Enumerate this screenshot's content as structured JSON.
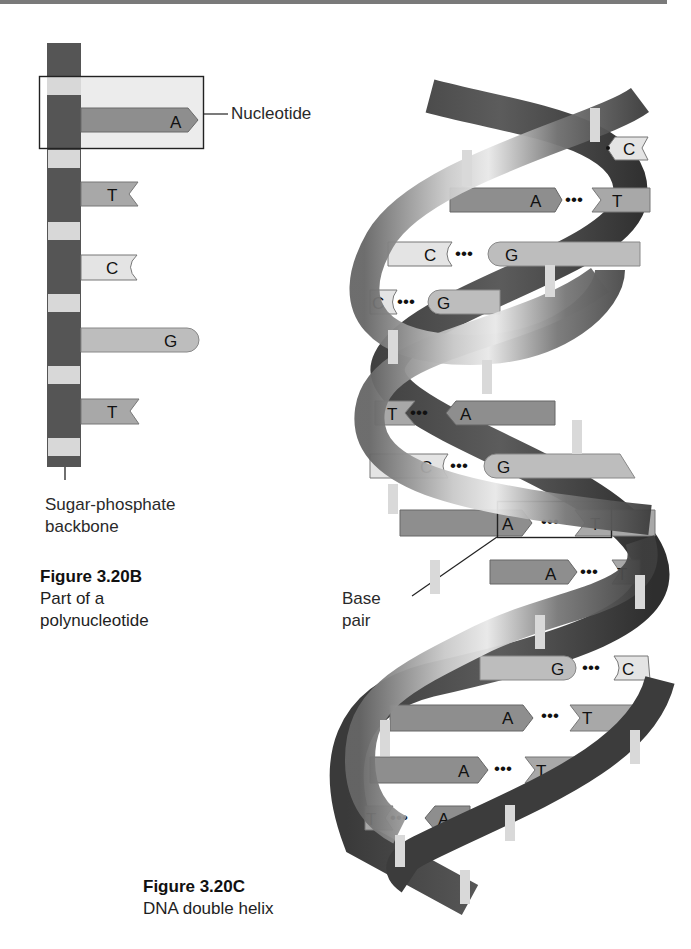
{
  "colors": {
    "backbone_dark": "#555555",
    "backbone_light": "#d8d8d8",
    "base_A": "#8e8e8e",
    "base_T": "#a8a8a8",
    "base_C": "#e4e4e4",
    "base_G": "#bdbdbd",
    "highlight_box": "#ededed",
    "outline": "#222222"
  },
  "figure_b": {
    "callout_nucleotide": "Nucleotide",
    "callout_backbone_line1": "Sugar-phosphate",
    "callout_backbone_line2": "backbone",
    "title": "Figure 3.20B",
    "caption_line1": "Part of a",
    "caption_line2": "polynucleotide",
    "bases": [
      {
        "letter": "A",
        "shape": "arrow"
      },
      {
        "letter": "T",
        "shape": "notch"
      },
      {
        "letter": "C",
        "shape": "cup"
      },
      {
        "letter": "G",
        "shape": "round"
      },
      {
        "letter": "T",
        "shape": "notch"
      }
    ]
  },
  "figure_c": {
    "callout_base_pair_line1": "Base",
    "callout_base_pair_line2": "pair",
    "title": "Figure 3.20C",
    "caption": "DNA double helix",
    "base_pairs": [
      {
        "left": "",
        "right": "C"
      },
      {
        "left": "A",
        "right": "T"
      },
      {
        "left": "C",
        "right": "G"
      },
      {
        "left": "C",
        "right": "G"
      },
      {
        "left": "T",
        "right": "A"
      },
      {
        "left": "C",
        "right": "G"
      },
      {
        "left": "A",
        "right": "T"
      },
      {
        "left": "A",
        "right": "T"
      },
      {
        "left": "G",
        "right": "C"
      },
      {
        "left": "A",
        "right": "T"
      },
      {
        "left": "A",
        "right": "T"
      },
      {
        "left": "T",
        "right": "A"
      }
    ],
    "dots": "•••"
  }
}
